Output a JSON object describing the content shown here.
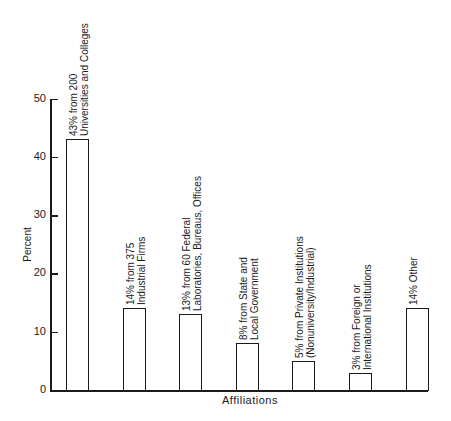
{
  "chart_data": {
    "type": "bar",
    "title": "",
    "xlabel": "Affiliations",
    "ylabel": "Percent",
    "ylim": [
      0,
      50
    ],
    "yticks": [
      0,
      10,
      20,
      30,
      40,
      50
    ],
    "grid": false,
    "legend": null,
    "categories": [
      "43% from 200 Universities and Colleges",
      "14% from 375 Industrial Firms",
      "13% from 60 Federal Laboratories, Bureaus, Offices",
      "8% from State and Local Government",
      "5% from Private Institutions (Nonuniversity/Industrial)",
      "3% from Foreign or International Institutions",
      "14% Other"
    ],
    "values": [
      43,
      14,
      13,
      8,
      5,
      3,
      14
    ],
    "bar_labels": [
      [
        "43% from 200",
        "Universities and Colleges"
      ],
      [
        "14% from 375",
        "Industrial Firms"
      ],
      [
        "13% from 60 Federal",
        "Laboratories, Bureaus, Offices"
      ],
      [
        "8% from State and",
        "Local Government"
      ],
      [
        "5% from Private Institutions",
        "(Nonuniversity/Industrial)"
      ],
      [
        "3% from Foreign or",
        "International Institutions"
      ],
      [
        "14% Other"
      ]
    ]
  },
  "axis": {
    "y_label": "Percent",
    "x_label": "Affiliations",
    "tick_labels": [
      "0",
      "10",
      "20",
      "30",
      "40",
      "50"
    ]
  }
}
